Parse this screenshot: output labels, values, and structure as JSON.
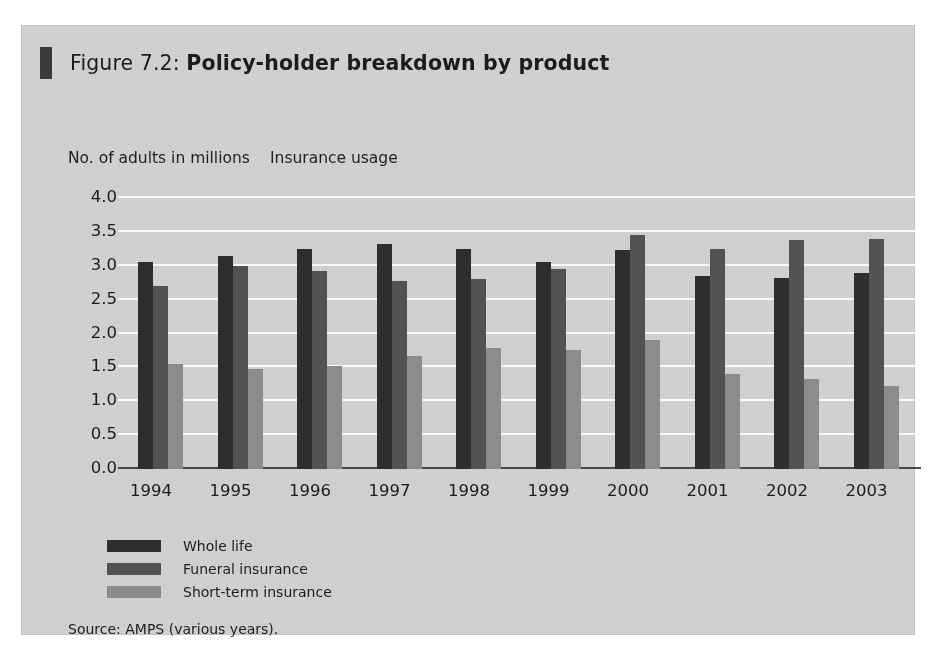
{
  "figure": {
    "prefix": "Figure 7.2: ",
    "title": "Policy-holder breakdown by product",
    "source": "Source: AMPS (various years)."
  },
  "captions": {
    "y_axis": "No. of adults in millions",
    "plot": "Insurance usage"
  },
  "colors": {
    "card_background": "#d2d2d2",
    "title_marker": "#3b3b3b",
    "gridline": "#fcfcfc",
    "axis": "#4a4a4a",
    "series_whole_life": "#2e2e2e",
    "series_funeral": "#535353",
    "series_short_term": "#8d8d8d",
    "text": "#1c1c1c"
  },
  "chart_data": {
    "type": "bar",
    "title": "Insurance usage",
    "xlabel": "",
    "ylabel": "No. of adults in millions",
    "ylim": [
      0.0,
      4.0
    ],
    "ytick_labels": [
      "4.0",
      "3.5",
      "3.0",
      "2.5",
      "2.0",
      "1.5",
      "1.0",
      "0.5",
      "0.0"
    ],
    "ytick_values": [
      4.0,
      3.5,
      3.0,
      2.5,
      2.0,
      1.5,
      1.0,
      0.5,
      0.0
    ],
    "grid": true,
    "legend_position": "bottom-left",
    "categories": [
      "1994",
      "1995",
      "1996",
      "1997",
      "1998",
      "1999",
      "2000",
      "2001",
      "2002",
      "2003"
    ],
    "series": [
      {
        "name": "Whole life",
        "color": "#2e2e2e",
        "values": [
          3.05,
          3.15,
          3.25,
          3.32,
          3.25,
          3.05,
          3.23,
          2.85,
          2.82,
          2.9
        ]
      },
      {
        "name": "Funeral insurance",
        "color": "#535353",
        "values": [
          2.7,
          3.0,
          2.93,
          2.78,
          2.8,
          2.95,
          3.45,
          3.25,
          3.38,
          3.4
        ]
      },
      {
        "name": "Short-term insurance",
        "color": "#8d8d8d",
        "values": [
          1.55,
          1.48,
          1.52,
          1.67,
          1.78,
          1.75,
          1.9,
          1.4,
          1.33,
          1.23
        ]
      }
    ]
  }
}
